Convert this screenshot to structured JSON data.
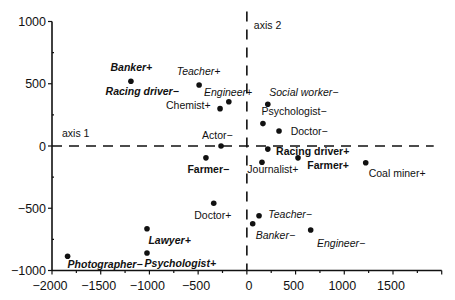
{
  "chart_data": {
    "type": "scatter",
    "title": "",
    "xlabel": "axis 1",
    "ylabel": "axis 2",
    "xlim": [
      -2000,
      2000
    ],
    "ylim": [
      -1000,
      1000
    ],
    "x_ticks": [
      -2000,
      -1500,
      -1000,
      -500,
      0,
      500,
      1000,
      1500
    ],
    "x_tick_labels": [
      "−2000",
      "−1500",
      "−1000",
      "−500",
      "0",
      "500",
      "1000",
      "1500"
    ],
    "y_ticks": [
      -1000,
      -500,
      0,
      500,
      1000
    ],
    "y_tick_labels": [
      "−1000",
      "−500",
      "0",
      "500",
      "1000"
    ],
    "grid": false,
    "reference_lines": "dashed lines at x=0 and y=0",
    "points": [
      {
        "label": "Banker+",
        "x": -1190,
        "y": 520,
        "style": "bold-italic",
        "lx": -1400,
        "ly": 600
      },
      {
        "label": "Racing driver−",
        "x": -1190,
        "y": 520,
        "style": "bold-italic",
        "lx": -1450,
        "ly": 410,
        "marker": false
      },
      {
        "label": "Teacher+",
        "x": -490,
        "y": 490,
        "style": "italic",
        "lx": -720,
        "ly": 570
      },
      {
        "label": "Engineer+",
        "x": -185,
        "y": 355,
        "style": "italic",
        "lx": -440,
        "ly": 400
      },
      {
        "label": "Chemist+",
        "x": -275,
        "y": 300,
        "style": "normal",
        "lx": -830,
        "ly": 300
      },
      {
        "label": "Social worker−",
        "x": 215,
        "y": 335,
        "style": "italic",
        "lx": 230,
        "ly": 400
      },
      {
        "label": "Psychologist−",
        "x": 165,
        "y": 180,
        "style": "normal",
        "lx": 150,
        "ly": 245
      },
      {
        "label": "Doctor−",
        "x": 330,
        "y": 120,
        "style": "normal",
        "lx": 450,
        "ly": 90
      },
      {
        "label": "Actor−",
        "x": -265,
        "y": 0,
        "style": "normal",
        "lx": -460,
        "ly": 55
      },
      {
        "label": "Racing driver+",
        "x": 215,
        "y": -25,
        "style": "bold",
        "lx": 300,
        "ly": -70
      },
      {
        "label": "Farmer−",
        "x": -420,
        "y": -95,
        "style": "bold",
        "lx": -610,
        "ly": -215
      },
      {
        "label": "Journalist+",
        "x": 155,
        "y": -130,
        "style": "normal",
        "lx": 5,
        "ly": -215
      },
      {
        "label": "Farmer+",
        "x": 525,
        "y": -95,
        "style": "bold",
        "lx": 620,
        "ly": -185
      },
      {
        "label": "Coal miner+",
        "x": 1220,
        "y": -135,
        "style": "normal",
        "lx": 1250,
        "ly": -245
      },
      {
        "label": "Doctor+",
        "x": -340,
        "y": -460,
        "style": "normal",
        "lx": -540,
        "ly": -590
      },
      {
        "label": "Teacher−",
        "x": 125,
        "y": -560,
        "style": "italic",
        "lx": 220,
        "ly": -580
      },
      {
        "label": "Banker−",
        "x": 60,
        "y": -625,
        "style": "italic",
        "lx": 90,
        "ly": -750
      },
      {
        "label": "Engineer−",
        "x": 655,
        "y": -675,
        "style": "italic",
        "lx": 720,
        "ly": -810
      },
      {
        "label": "Lawyer+",
        "x": -1025,
        "y": -665,
        "style": "bold-italic",
        "lx": -1010,
        "ly": -790
      },
      {
        "label": "Psychologist+",
        "x": -1025,
        "y": -860,
        "style": "bold-italic",
        "lx": -1050,
        "ly": -970
      },
      {
        "label": "Photographer−",
        "x": -1840,
        "y": -885,
        "style": "bold-italic",
        "lx": -1840,
        "ly": -980
      }
    ]
  }
}
